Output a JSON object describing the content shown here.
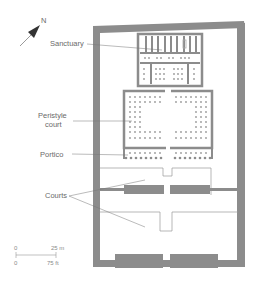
{
  "diagram": {
    "type": "temple-floor-plan",
    "north": {
      "label": "N"
    },
    "labels": {
      "sanctuary": "Sanctuary",
      "peristyle_line1": "Peristyle",
      "peristyle_line2": "court",
      "portico": "Portico",
      "courts": "Courts"
    },
    "scale": {
      "metric_zero": "0",
      "metric_max": "25 m",
      "imperial_zero": "0",
      "imperial_max": "75 ft"
    },
    "colors": {
      "wall": "#8c8c8c",
      "line": "#9a9a9a",
      "text": "#6a6a6a"
    }
  }
}
